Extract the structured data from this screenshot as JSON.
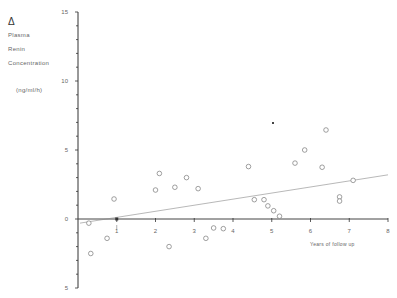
{
  "chart_data": {
    "type": "scatter",
    "title": "",
    "ylabel_lines": [
      "Δ",
      "Plasma",
      "Renin",
      "Concentration",
      "",
      "(ng/ml/h)"
    ],
    "ylabel": "Δ Plasma Renin Concentration (ng/ml/h)",
    "xlabel": "Years of follow up",
    "xlim": [
      0,
      8
    ],
    "ylim": [
      -5,
      15
    ],
    "x_ticks": [
      1,
      2,
      3,
      4,
      5,
      6,
      7,
      8
    ],
    "y_tick_labels": [
      15,
      10,
      5,
      0,
      -5
    ],
    "y_tick_display": [
      "15",
      "10",
      "5",
      "0",
      "5"
    ],
    "grid": false,
    "series": [
      {
        "name": "patients",
        "marker": "open-circle",
        "points": [
          [
            0.28,
            -0.3
          ],
          [
            0.33,
            -2.5
          ],
          [
            0.75,
            -1.4
          ],
          [
            0.93,
            1.45
          ],
          [
            2.0,
            2.1
          ],
          [
            2.1,
            3.3
          ],
          [
            2.35,
            -2.0
          ],
          [
            2.5,
            2.3
          ],
          [
            2.8,
            3.0
          ],
          [
            3.1,
            2.2
          ],
          [
            3.3,
            -1.4
          ],
          [
            3.5,
            -0.65
          ],
          [
            3.75,
            -0.7
          ],
          [
            4.4,
            3.8
          ],
          [
            4.55,
            1.4
          ],
          [
            4.8,
            1.4
          ],
          [
            4.9,
            0.95
          ],
          [
            5.05,
            0.6
          ],
          [
            5.2,
            0.2
          ],
          [
            5.6,
            4.05
          ],
          [
            5.85,
            5.0
          ],
          [
            6.3,
            3.75
          ],
          [
            6.4,
            6.45
          ],
          [
            6.75,
            1.6
          ],
          [
            6.75,
            1.3
          ],
          [
            7.1,
            2.8
          ]
        ]
      },
      {
        "name": "regression",
        "type": "line",
        "points": [
          [
            0,
            -0.3
          ],
          [
            8,
            3.2
          ]
        ]
      }
    ],
    "annotations": [
      {
        "type": "filled-dot",
        "x": 1.0,
        "y": 0.0
      },
      {
        "type": "speck",
        "x": 5.0,
        "y": 7.0
      }
    ]
  },
  "labels": {
    "delta": "Δ",
    "plasma": "Plasma",
    "renin": "Renin",
    "concentration": "Concentration",
    "units": "(ng/ml/h)",
    "xaxis_title": "Years of follow up"
  }
}
